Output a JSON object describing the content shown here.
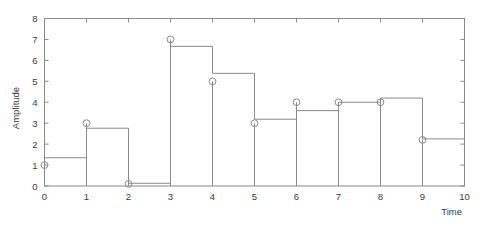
{
  "chart_data": {
    "type": "line",
    "title": "",
    "subtitle": "",
    "xlabel": "Time",
    "ylabel": "Amplitude",
    "xlim": [
      0,
      10
    ],
    "ylim": [
      0,
      8
    ],
    "xticks": [
      0,
      1,
      2,
      3,
      4,
      5,
      6,
      7,
      8,
      9,
      10
    ],
    "yticks": [
      0,
      1,
      2,
      3,
      4,
      5,
      6,
      7,
      8
    ],
    "xtick_labels": [
      "0",
      "1",
      "2",
      "3",
      "4",
      "5",
      "6",
      "7",
      "8",
      "9",
      "10"
    ],
    "ytick_labels": [
      "0",
      "1",
      "2",
      "3",
      "4",
      "5",
      "6",
      "7",
      "8"
    ],
    "grid": false,
    "legend": null,
    "legend_position": "none",
    "frame": "box",
    "series": [
      {
        "name": "samples",
        "style": "markers",
        "marker": "open-circle",
        "color": "#8a8a8a",
        "x": [
          0,
          1,
          2,
          3,
          4,
          5,
          6,
          7,
          8,
          9
        ],
        "values": [
          1.0,
          3.0,
          0.1,
          7.0,
          5.0,
          3.0,
          4.0,
          4.0,
          4.0,
          2.2
        ]
      },
      {
        "name": "zero-order-hold",
        "style": "step-post",
        "color": "#8a8a8a",
        "x": [
          0,
          1,
          2,
          3,
          4,
          5,
          6,
          7,
          8,
          9,
          10
        ],
        "values": [
          1.35,
          2.76,
          0.13,
          6.67,
          5.38,
          3.19,
          3.6,
          4.0,
          4.2,
          2.25,
          2.25
        ]
      }
    ]
  },
  "axes": {
    "ylabel": "Amplitude",
    "xlabel": "Time",
    "ytick_labels": [
      "0",
      "1",
      "2",
      "3",
      "4",
      "5",
      "6",
      "7",
      "8"
    ],
    "xtick_labels": [
      "0",
      "1",
      "2",
      "3",
      "4",
      "5",
      "6",
      "7",
      "8",
      "9",
      "10"
    ]
  }
}
